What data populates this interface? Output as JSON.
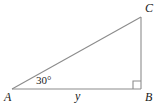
{
  "figure": {
    "type": "geometry-diagram",
    "stroke_color": "#8c8c8c",
    "text_color": "#1a1a1a",
    "background_color": "#ffffff",
    "vertices": {
      "A": {
        "label": "A",
        "x": 12,
        "y": 89
      },
      "B": {
        "label": "B",
        "x": 141,
        "y": 89
      },
      "C": {
        "label": "C",
        "x": 141,
        "y": 17
      }
    },
    "sides": {
      "base_label": "y",
      "base_from": "A",
      "base_to": "B",
      "vertical_from": "B",
      "vertical_to": "C",
      "hypotenuse_from": "A",
      "hypotenuse_to": "C"
    },
    "angles": {
      "at_A": "30°",
      "at_B": "90°",
      "right_angle_marker": true,
      "right_angle_marker_size": 8
    }
  }
}
